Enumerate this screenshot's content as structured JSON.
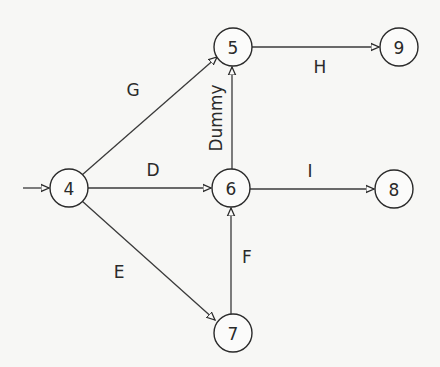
{
  "diagram": {
    "type": "activity-on-arrow network",
    "nodes": [
      {
        "id": "4",
        "label": "4",
        "x": 69,
        "y": 188
      },
      {
        "id": "5",
        "label": "5",
        "x": 233,
        "y": 47
      },
      {
        "id": "6",
        "label": "6",
        "x": 231,
        "y": 188
      },
      {
        "id": "7",
        "label": "7",
        "x": 233,
        "y": 333
      },
      {
        "id": "8",
        "label": "8",
        "x": 394,
        "y": 189
      },
      {
        "id": "9",
        "label": "9",
        "x": 399,
        "y": 47
      }
    ],
    "edges": [
      {
        "label": "",
        "from": "entry",
        "to": "4"
      },
      {
        "label": "G",
        "from": "4",
        "to": "5"
      },
      {
        "label": "D",
        "from": "4",
        "to": "6"
      },
      {
        "label": "E",
        "from": "4",
        "to": "7"
      },
      {
        "label": "H",
        "from": "5",
        "to": "9"
      },
      {
        "label": "Dummy",
        "from": "6",
        "to": "5"
      },
      {
        "label": "I",
        "from": "6",
        "to": "8"
      },
      {
        "label": "F",
        "from": "7",
        "to": "6"
      }
    ],
    "labels": {
      "G": "G",
      "D": "D",
      "E": "E",
      "H": "H",
      "I": "I",
      "F": "F",
      "dummy": "Dummy"
    }
  },
  "colors": {
    "ink": "#2a2a2a",
    "paper": "#f7f7f5"
  }
}
